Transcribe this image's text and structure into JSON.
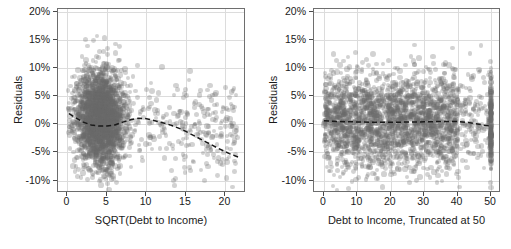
{
  "figure": {
    "title": "",
    "panel_count": 2,
    "marker_color": "#696969",
    "marker_opacity": 0.3,
    "trend_color": "#1a1a1a",
    "grid_color": "#dcdcdc",
    "frame_color": "#6e6e6e",
    "axis_text_color": "#1a1a1a"
  },
  "chart_data": [
    {
      "type": "scatter",
      "panel": "left",
      "title": "",
      "xlabel": "SQRT(Debt to Income)",
      "ylabel": "Residuals",
      "xlim": [
        -1.2,
        22.6
      ],
      "ylim": [
        -0.122,
        0.205
      ],
      "grid": true,
      "legend": "none",
      "xticks": [
        0,
        5,
        10,
        15,
        20
      ],
      "xticklabels": [
        "0",
        "5",
        "10",
        "15",
        "20"
      ],
      "yticks": [
        0.2,
        0.15,
        0.1,
        0.05,
        0.0,
        -0.05,
        -0.1
      ],
      "yticklabels": [
        "20%",
        "15%",
        "10%",
        "5%",
        "0%",
        "-5%",
        "-10%"
      ],
      "annotations": [
        "Dense point cloud concentrated between x=1 and x=7",
        "Sparse right tail extending to x=21.5",
        "Dashed LOESS smoother overlaid"
      ],
      "trend_line": {
        "style": "dashed",
        "name": "LOESS smoother",
        "x": [
          0.2,
          1.0,
          2.0,
          3.0,
          4.0,
          5.0,
          6.0,
          7.0,
          8.0,
          9.0,
          10.0,
          11.5,
          13.0,
          14.5,
          16.0,
          17.5,
          19.0,
          20.5,
          21.6
        ],
        "y": [
          0.019,
          0.012,
          0.004,
          -0.001,
          -0.003,
          -0.003,
          -0.001,
          0.004,
          0.008,
          0.011,
          0.01,
          0.005,
          -0.001,
          -0.009,
          -0.02,
          -0.031,
          -0.042,
          -0.052,
          -0.058
        ]
      },
      "points_summary": {
        "n_approx": 4000,
        "x_mode": 4.2,
        "y_center": 0.012,
        "y_spread": 0.055,
        "description": "Residuals vs square-root transformed debt-to-income ratio"
      }
    },
    {
      "type": "scatter",
      "panel": "right",
      "title": "",
      "xlabel": "Debt to Income, Truncated at 50",
      "ylabel": "Residuals",
      "xlim": [
        -3.0,
        53.0
      ],
      "ylim": [
        -0.122,
        0.205
      ],
      "grid": true,
      "legend": "none",
      "xticks": [
        0,
        10,
        20,
        30,
        40,
        50
      ],
      "xticklabels": [
        "0",
        "10",
        "20",
        "30",
        "40",
        "50"
      ],
      "yticks": [
        0.2,
        0.15,
        0.1,
        0.05,
        0.0,
        -0.05,
        -0.1
      ],
      "yticklabels": [
        "20%",
        "15%",
        "10%",
        "5%",
        "0%",
        "-5%",
        "-10%"
      ],
      "annotations": [
        "Uniform horizontal band of residuals from x=0 to x=40",
        "Density thins out between x=40 and x=49",
        "Dense vertical stack of truncated observations at x=50",
        "Dashed LOESS smoother overlaid"
      ],
      "trend_line": {
        "style": "dashed",
        "name": "LOESS smoother",
        "x": [
          0.0,
          5.0,
          10.0,
          15.0,
          20.0,
          25.0,
          30.0,
          35.0,
          40.0,
          43.0,
          46.0,
          48.0,
          50.0
        ],
        "y": [
          0.0062,
          0.005,
          0.0042,
          0.0038,
          0.0038,
          0.004,
          0.0045,
          0.005,
          0.005,
          0.0035,
          0.0005,
          -0.0015,
          -0.003
        ]
      },
      "points_summary": {
        "n_approx": 4000,
        "x_mode": 20.0,
        "y_center": 0.005,
        "y_spread": 0.055,
        "description": "Residuals vs untransformed debt-to-income ratio truncated at 50"
      }
    }
  ]
}
